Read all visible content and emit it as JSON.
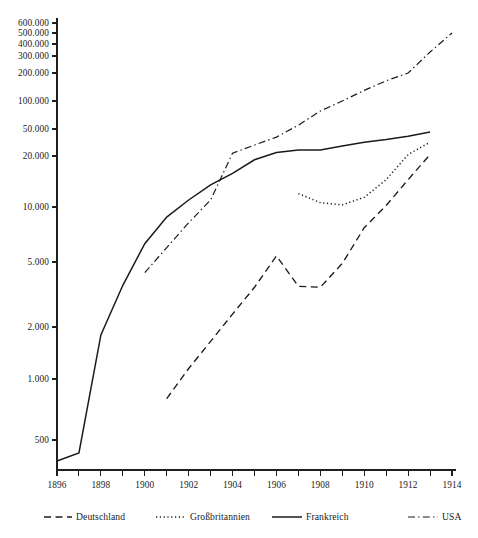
{
  "chart_data": {
    "type": "line",
    "title": "",
    "subtitle": "",
    "xlabel": "",
    "ylabel": "",
    "grid": false,
    "yscale": "log",
    "legend_position": "bottom",
    "xlim": [
      1896,
      1914
    ],
    "ylim": [
      280,
      600000
    ],
    "x_ticks_major": [
      1896,
      1898,
      1900,
      1902,
      1904,
      1906,
      1908,
      1910,
      1912,
      1914
    ],
    "x_tick_labels": [
      "1896",
      "1898",
      "1900",
      "1902",
      "1904",
      "1906",
      "1908",
      "1910",
      "1912",
      "1914"
    ],
    "x_ticks_minor": [
      1897,
      1899,
      1901,
      1903,
      1905,
      1907,
      1909,
      1911,
      1913
    ],
    "y_ticks": [
      500,
      1000,
      2000,
      5000,
      10000,
      20000,
      50000,
      100000,
      200000,
      300000,
      400000,
      500000,
      600000
    ],
    "y_tick_labels": [
      "500",
      "1.000",
      "2.000",
      "5.000",
      "10.000",
      "20.000",
      "50.000",
      "100.000",
      "200.000",
      "300.000",
      "400.000",
      "500.000",
      "600.000"
    ],
    "series": [
      {
        "name": "Deutschland",
        "style": "dashed",
        "color": "#1b1b1b",
        "x": [
          1901,
          1902,
          1903,
          1904,
          1905,
          1906,
          1907,
          1908,
          1909,
          1910,
          1911,
          1912,
          1913
        ],
        "values": [
          800,
          1150,
          1650,
          2400,
          3500,
          5400,
          3550,
          3500,
          4900,
          7700,
          10200,
          14500,
          21000
        ]
      },
      {
        "name": "Großbritannien",
        "style": "dotted",
        "color": "#1b1b1b",
        "x": [
          1907,
          1908,
          1909,
          1910,
          1911,
          1912,
          1913
        ],
        "values": [
          12000,
          10600,
          10300,
          11400,
          14500,
          21000,
          32000
        ]
      },
      {
        "name": "Frankreich",
        "style": "solid",
        "color": "#1b1b1b",
        "x": [
          1896,
          1897,
          1898,
          1899,
          1900,
          1901,
          1902,
          1903,
          1904,
          1905,
          1906,
          1907,
          1908,
          1909,
          1910,
          1911,
          1912,
          1913
        ],
        "values": [
          280,
          350,
          1800,
          3600,
          6300,
          8800,
          11000,
          13500,
          15800,
          19000,
          22500,
          24500,
          24500,
          28000,
          32000,
          35000,
          39000,
          45000
        ]
      },
      {
        "name": "USA",
        "style": "dashdot",
        "color": "#1b1b1b",
        "x": [
          1900,
          1901,
          1902,
          1903,
          1904,
          1905,
          1906,
          1907,
          1908,
          1909,
          1910,
          1911,
          1912,
          1913,
          1914
        ],
        "values": [
          4300,
          6000,
          8200,
          11000,
          22000,
          29000,
          38000,
          55000,
          78000,
          100000,
          130000,
          165000,
          200000,
          330000,
          500000
        ]
      }
    ],
    "legend": [
      {
        "label": "Deutschland",
        "style": "dashed"
      },
      {
        "label": "Großbritannien",
        "style": "dotted"
      },
      {
        "label": "Frankreich",
        "style": "solid"
      },
      {
        "label": "USA",
        "style": "dashdot"
      }
    ]
  }
}
